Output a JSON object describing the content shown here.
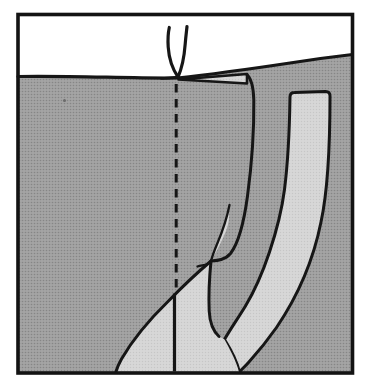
{
  "diagram": {
    "kind": "book-illustration",
    "regions": {
      "sky": "white band above ground surface",
      "soil": "dark halftone-stippled earth",
      "root_channels": "light gray infilled channels",
      "seedling": "two-leaf sprout at ground surface",
      "root_path": "dashed projection line continuing as solid taproot"
    },
    "colors": {
      "page_background": "#ffffff",
      "sky": "#ffffff",
      "soil_base": "#a4a4a4",
      "soil_dot": "#868686",
      "channel_base": "#d7d7d7",
      "channel_dot": "#c6c6c6",
      "outline": "#161616",
      "frame": "#131313",
      "speck": "#6a6a6a"
    }
  }
}
